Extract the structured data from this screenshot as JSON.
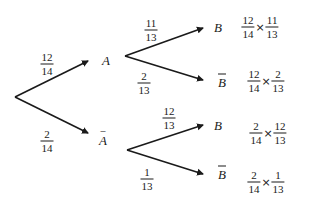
{
  "diagram": {
    "type": "probability-tree",
    "first_stage": {
      "branches": [
        {
          "event": "A",
          "overline": false,
          "probability": {
            "num": "12",
            "den": "14"
          }
        },
        {
          "event": "A",
          "overline": true,
          "probability": {
            "num": "2",
            "den": "14"
          }
        }
      ]
    },
    "second_stage": {
      "from_A": [
        {
          "event": "B",
          "overline": false,
          "probability": {
            "num": "11",
            "den": "13"
          },
          "product": {
            "a": {
              "num": "12",
              "den": "14"
            },
            "op": "×",
            "b": {
              "num": "11",
              "den": "13"
            }
          }
        },
        {
          "event": "B",
          "overline": true,
          "probability": {
            "num": "2",
            "den": "13"
          },
          "product": {
            "a": {
              "num": "12",
              "den": "14"
            },
            "op": "×",
            "b": {
              "num": "2",
              "den": "13"
            }
          }
        }
      ],
      "from_not_A": [
        {
          "event": "B",
          "overline": false,
          "probability": {
            "num": "12",
            "den": "13"
          },
          "product": {
            "a": {
              "num": "2",
              "den": "14"
            },
            "op": "×",
            "b": {
              "num": "12",
              "den": "13"
            }
          }
        },
        {
          "event": "B",
          "overline": true,
          "probability": {
            "num": "1",
            "den": "13"
          },
          "product": {
            "a": {
              "num": "2",
              "den": "14"
            },
            "op": "×",
            "b": {
              "num": "1",
              "den": "13"
            }
          }
        }
      ]
    },
    "colors": {
      "line": "#1a1a1a",
      "background": "#ffffff"
    }
  }
}
